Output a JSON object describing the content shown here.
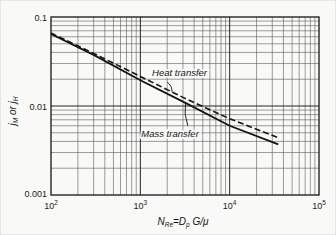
{
  "figure": {
    "colors": {
      "paper": "#f9f9f7",
      "ink": "#141414",
      "major_grid": "#242424",
      "minor_grid": "#4d4d4d",
      "tick_text": "#1c1c1c"
    }
  },
  "chart_data": {
    "type": "line",
    "title": "",
    "x_scale": "log",
    "y_scale": "log",
    "xlim": [
      100,
      100000
    ],
    "ylim": [
      0.001,
      0.1
    ],
    "grid": "log major and minor, both axes",
    "legend_position": "none (inline annotated labels)",
    "xlabel_parts": [
      {
        "t": "N"
      },
      {
        "t": "Re",
        "sub": true
      },
      {
        "t": "="
      },
      {
        "t": "D"
      },
      {
        "t": "p",
        "sub": true
      },
      {
        "t": " G/μ"
      }
    ],
    "ylabel_parts": [
      {
        "t": "j"
      },
      {
        "t": "M",
        "sub": true
      },
      {
        "t": " or "
      },
      {
        "t": "j"
      },
      {
        "t": "H",
        "sub": true
      }
    ],
    "x_ticks": [
      {
        "base": "10",
        "exp": "2",
        "value": 100
      },
      {
        "base": "10",
        "exp": "3",
        "value": 1000
      },
      {
        "base": "10",
        "exp": "4",
        "value": 10000
      },
      {
        "base": "10",
        "exp": "5",
        "value": 100000
      }
    ],
    "y_ticks": [
      {
        "label": "0.1",
        "value": 0.1
      },
      {
        "label": "0.01",
        "value": 0.01
      },
      {
        "label": "0.001",
        "value": 0.001
      }
    ],
    "series": [
      {
        "name": "Heat transfer",
        "style": "dashed",
        "x": [
          100,
          300,
          1000,
          3000,
          10000,
          35000
        ],
        "y": [
          0.066,
          0.039,
          0.0215,
          0.0125,
          0.0072,
          0.0044
        ]
      },
      {
        "name": "Mass transfer",
        "style": "solid",
        "x": [
          100,
          300,
          1000,
          3000,
          10000,
          35000
        ],
        "y": [
          0.0645,
          0.0375,
          0.0195,
          0.0112,
          0.006,
          0.0037
        ]
      }
    ],
    "annotations": [
      {
        "text": "Heat transfer",
        "x": 2750,
        "y": 0.0235,
        "leader": {
          "from": [
            2000,
            0.0185
          ],
          "to": [
            2260,
            0.0144
          ]
        }
      },
      {
        "text": "Mass transfer",
        "x": 2150,
        "y": 0.0048,
        "leader": {
          "from": [
            3400,
            0.006
          ],
          "to": [
            3200,
            0.0108
          ]
        }
      }
    ]
  }
}
